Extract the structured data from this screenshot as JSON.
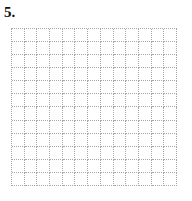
{
  "page": {
    "background_color": "#ffffff"
  },
  "problem": {
    "number_label": "5."
  },
  "grid": {
    "columns": 13,
    "rows": 12,
    "line_style": "dotted",
    "line_color": "#a6a6a6",
    "background_color": "#ffffff",
    "content": "empty"
  }
}
